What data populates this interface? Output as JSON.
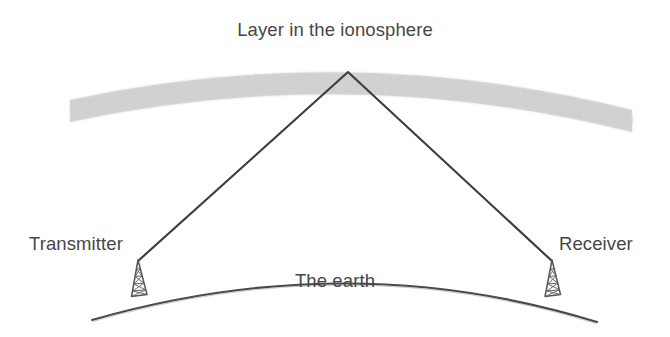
{
  "figure": {
    "kind": "physics-diagram",
    "background_color": "#ffffff"
  },
  "labels": {
    "ionosphere": "Layer in the ionosphere",
    "transmitter": "Transmitter",
    "receiver": "Receiver",
    "earth": "The earth"
  },
  "colors": {
    "ionosphere_band": "#d8d8d8",
    "ray_path": "#3c3c3c",
    "earth_curve": "#4a4a4a",
    "tower": "#555555",
    "text": "#474747"
  },
  "geometry": {
    "ionosphere_band": {
      "left_end": [
        70,
        110
      ],
      "apex": [
        350,
        62
      ],
      "right_end": [
        632,
        121
      ],
      "thickness": 22
    },
    "ray_path": {
      "transmitter_point": [
        138,
        261
      ],
      "reflection_point": [
        348,
        72
      ],
      "receiver_point": [
        552,
        261
      ]
    },
    "earth_curve": {
      "left_end": [
        92,
        320
      ],
      "apex": [
        350,
        269
      ],
      "right_end": [
        597,
        322
      ]
    },
    "transmitter_tower": {
      "apex": [
        138,
        261
      ],
      "base_left": [
        131,
        296
      ],
      "base_right": [
        147,
        294
      ]
    },
    "receiver_tower": {
      "apex": [
        552,
        261
      ],
      "base_left": [
        545,
        296
      ],
      "base_right": [
        561,
        294
      ]
    }
  }
}
